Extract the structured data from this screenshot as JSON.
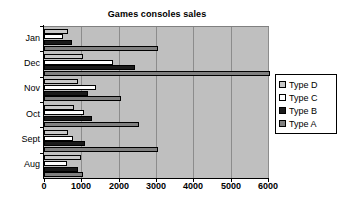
{
  "chart_data": {
    "type": "bar",
    "orientation": "horizontal",
    "title": "Games consoles sales",
    "xlabel": "",
    "ylabel": "",
    "xlim": [
      0,
      6000
    ],
    "categories": [
      "Aug",
      "Sept",
      "Oct",
      "Nov",
      "Dec",
      "Jan"
    ],
    "xticks": [
      "0",
      "1000",
      "2000",
      "3000",
      "4000",
      "5000",
      "6000"
    ],
    "xtick_values": [
      0,
      1000,
      2000,
      3000,
      4000,
      5000,
      6000
    ],
    "grid": true,
    "legend_position": "right",
    "series": [
      {
        "name": "Type A",
        "color": "#808080",
        "values": [
          1050,
          3050,
          2550,
          2050,
          6050,
          3050
        ]
      },
      {
        "name": "Type B",
        "color": "#1a1a1a",
        "values": [
          900,
          1100,
          1280,
          1180,
          2450,
          750
        ]
      },
      {
        "name": "Type C",
        "color": "#ffffff",
        "values": [
          620,
          780,
          1070,
          1380,
          1850,
          500
        ]
      },
      {
        "name": "Type D",
        "color": "#c8c8c8",
        "values": [
          1000,
          630,
          800,
          900,
          1050,
          650
        ]
      }
    ],
    "legend": [
      {
        "label": "Type D",
        "color": "#c8c8c8"
      },
      {
        "label": "Type C",
        "color": "#ffffff"
      },
      {
        "label": "Type B",
        "color": "#1a1a1a"
      },
      {
        "label": "Type A",
        "color": "#808080"
      }
    ],
    "colors": {
      "plot_background": "#bfbfbf",
      "gridline": "#8c8c8c",
      "axis": "#000000",
      "page_background": "#ffffff"
    }
  }
}
